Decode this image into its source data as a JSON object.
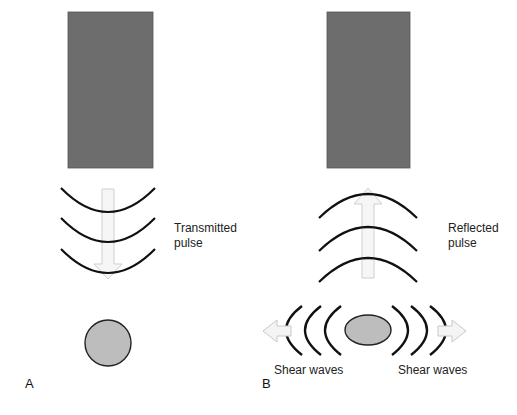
{
  "figure": {
    "panel_a": {
      "letter": "A",
      "label_line1": "Transmitted",
      "label_line2": "pulse"
    },
    "panel_b": {
      "letter": "B",
      "label_line1": "Reflected",
      "label_line2": "pulse",
      "shear_left": "Shear waves",
      "shear_right": "Shear waves"
    },
    "colors": {
      "transducer": "#6d6d6d",
      "target_fill": "#bdbdbd",
      "wave_stroke": "#111111",
      "arrow_fill": "#f4f4f4",
      "arrow_stroke": "#c8c8c8"
    }
  }
}
